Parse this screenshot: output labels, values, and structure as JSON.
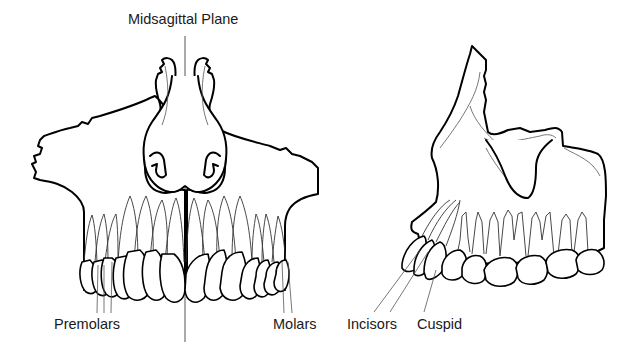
{
  "title": "Midsagittal Plane",
  "views": {
    "frontal": {
      "name": "Maxilla anterior view",
      "labels": {
        "premolars": "Premolars",
        "molars": "Molars"
      }
    },
    "lateral": {
      "name": "Maxilla lateral view",
      "labels": {
        "incisors": "Incisors",
        "cuspid": "Cuspid"
      }
    }
  },
  "colors": {
    "line": "#000000",
    "background": "#ffffff",
    "text": "#1a1a1a"
  }
}
